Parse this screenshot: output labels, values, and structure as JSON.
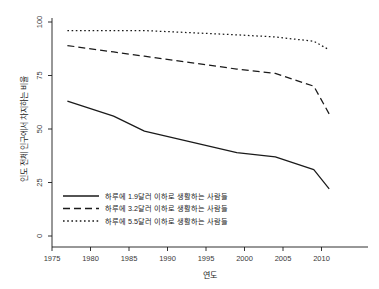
{
  "figure": {
    "background": "#ffffff",
    "ink_color": "#1a1a1a",
    "cropped_top_text": ""
  },
  "axis": {
    "x_title": "연도",
    "y_title": "인도 전체 인구에서 차지하는 비율",
    "x_ticks": [
      "1975",
      "1980",
      "1985",
      "1990",
      "1995",
      "2000",
      "2005",
      "2010"
    ],
    "y_ticks": [
      "0",
      "25",
      "50",
      "75",
      "100"
    ]
  },
  "legend": {
    "position": "bottom-left-inside",
    "items": [
      {
        "label": "하루에 1.9달러 이하로 생활하는 사람들",
        "style": "solid"
      },
      {
        "label": "하루에 3.2달러 이하로 생활하는 사람들",
        "style": "dashed"
      },
      {
        "label": "하루에 5.5달러 이하로 생활하는 사람들",
        "style": "dotted"
      }
    ]
  },
  "chart_data": {
    "type": "line",
    "title": "",
    "subtitle": "",
    "xlabel": "연도",
    "ylabel": "인도 전체 인구에서 차지하는 비율",
    "xlim": [
      1973,
      2012
    ],
    "ylim": [
      0,
      100
    ],
    "xticks": [
      1975,
      1980,
      1985,
      1990,
      1995,
      2000,
      2005,
      2010
    ],
    "yticks": [
      0,
      25,
      50,
      75,
      100
    ],
    "grid": false,
    "legend_position": "lower left",
    "x": [
      1977,
      1983,
      1987,
      1993,
      1999,
      2004,
      2009,
      2011
    ],
    "series": [
      {
        "name": "하루에 1.9달러 이하로 생활하는 사람들",
        "style": "solid",
        "values": [
          63,
          56,
          49,
          44,
          39,
          37,
          31,
          22
        ]
      },
      {
        "name": "하루에 3.2달러 이하로 생활하는 사람들",
        "style": "dashed",
        "values": [
          89,
          86,
          84,
          81,
          78,
          76,
          70,
          57
        ]
      },
      {
        "name": "하루에 5.5달러 이하로 생활하는 사람들",
        "style": "dotted",
        "values": [
          96,
          96,
          96,
          95,
          94,
          93,
          91,
          87
        ]
      }
    ]
  }
}
